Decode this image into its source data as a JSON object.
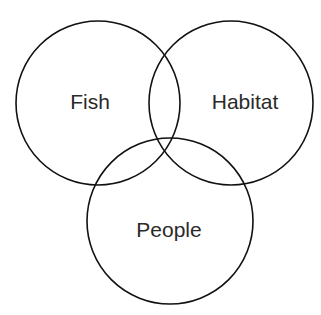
{
  "diagram": {
    "type": "venn",
    "stroke_color": "#111111",
    "text_color": "#2a2a2a",
    "sets": [
      {
        "label": "Fish",
        "cx": 98,
        "cy": 103,
        "r": 82,
        "tx": 90,
        "ty": 109
      },
      {
        "label": "Habitat",
        "cx": 231,
        "cy": 103,
        "r": 82,
        "tx": 245,
        "ty": 109
      },
      {
        "label": "People",
        "cx": 170,
        "cy": 221,
        "r": 83,
        "tx": 169,
        "ty": 237
      }
    ]
  }
}
